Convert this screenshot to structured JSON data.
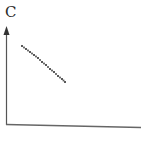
{
  "diagram": {
    "y_axis_label": "C",
    "x_axis_label": "",
    "colors": {
      "axis": "#555555",
      "curve": "#5a5a5a",
      "label": "#2a2a2a",
      "background": "#ffffff"
    },
    "curve_points": [
      [
        22,
        46
      ],
      [
        26,
        49
      ],
      [
        30,
        52
      ],
      [
        34,
        55
      ],
      [
        38,
        58
      ],
      [
        42,
        62
      ],
      [
        46,
        65
      ],
      [
        50,
        69
      ],
      [
        54,
        72
      ],
      [
        58,
        76
      ],
      [
        62,
        79
      ],
      [
        65,
        82
      ]
    ]
  },
  "chart_data": {
    "type": "scatter",
    "title": "",
    "xlabel": "",
    "ylabel": "C",
    "grid": false,
    "legend": null,
    "series": [
      {
        "name": "C",
        "style": "dotted decreasing curve",
        "x": [
          0.11,
          0.14,
          0.18,
          0.21,
          0.24,
          0.27,
          0.3,
          0.33,
          0.36,
          0.39,
          0.42,
          0.44
        ],
        "y": [
          0.81,
          0.78,
          0.75,
          0.71,
          0.68,
          0.64,
          0.61,
          0.56,
          0.53,
          0.49,
          0.46,
          0.43
        ]
      }
    ],
    "xlim": [
      0,
      1
    ],
    "ylim": [
      0,
      1
    ]
  }
}
